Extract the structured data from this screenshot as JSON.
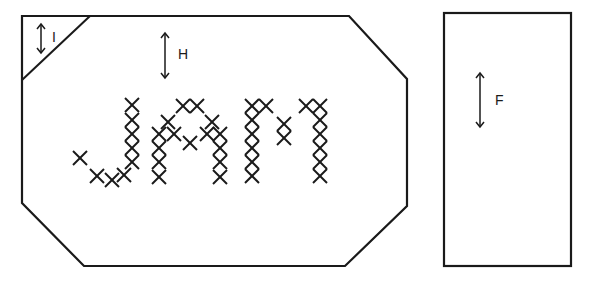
{
  "diagram": {
    "panel_left": {
      "shape": "octagon-like panel with clipped corners",
      "corner_label": "I",
      "height_label": "H",
      "lettering": "JAM",
      "lettering_style": "cross-stitch"
    },
    "panel_right": {
      "shape": "rectangle",
      "height_label": "F"
    },
    "colors": {
      "line": "#1a1a1a",
      "background": "#ffffff"
    }
  }
}
